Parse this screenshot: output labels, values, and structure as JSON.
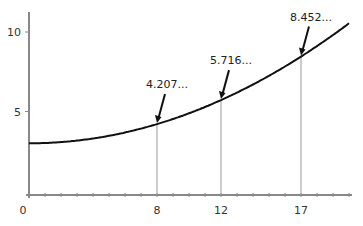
{
  "chart_data": {
    "type": "line",
    "title": "",
    "xlabel": "",
    "ylabel": "",
    "xlim": [
      0,
      20
    ],
    "ylim": [
      0,
      11
    ],
    "grid": false,
    "function": "y = 3 + x^2/53",
    "x": [
      0,
      2,
      4,
      6,
      8,
      10,
      12,
      14,
      16,
      17,
      18,
      20
    ],
    "series": [
      {
        "name": "curve",
        "values": [
          3.0,
          3.075,
          3.302,
          3.679,
          4.207,
          4.887,
          5.716,
          6.698,
          7.83,
          8.452,
          9.113,
          10.547
        ]
      }
    ],
    "x_ticks": [
      {
        "value": 0,
        "label": "0"
      },
      {
        "value": 8,
        "label": "8"
      },
      {
        "value": 12,
        "label": "12"
      },
      {
        "value": 17,
        "label": "17"
      }
    ],
    "y_ticks": [
      {
        "value": 5,
        "label": "5"
      },
      {
        "value": 10,
        "label": "10"
      }
    ],
    "annotations": [
      {
        "x": 8,
        "y": 4.207,
        "label": "4.207..."
      },
      {
        "x": 12,
        "y": 5.716,
        "label": "5.716..."
      },
      {
        "x": 17,
        "y": 8.452,
        "label": "8.452..."
      }
    ]
  },
  "colors": {
    "axis": "#888888",
    "curve": "#111111",
    "drop_line": "#999999",
    "arrow": "#111111"
  }
}
